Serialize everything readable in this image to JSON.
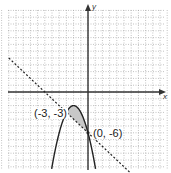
{
  "figure": {
    "type": "graph-of-system-of-inequalities",
    "axes": {
      "x_label": "x",
      "y_label": "y"
    },
    "grid": {
      "x_range": [
        -12,
        11
      ],
      "y_range": [
        -11,
        12
      ],
      "style": "dotted"
    },
    "curves": [
      {
        "name": "parabola",
        "equation": "y = -x^2 - 4x - 6",
        "style": "solid"
      },
      {
        "name": "line",
        "equation": "y = -x - 6",
        "style": "dashed"
      }
    ],
    "shaded_region": "between line and parabola for -3 <= x <= 0",
    "points": [
      {
        "label": "(-3, -3)",
        "x": -3,
        "y": -3
      },
      {
        "label": "(0, -6)",
        "x": 0,
        "y": -6
      }
    ],
    "colors": {
      "shade": "#c8c8c8",
      "ink": "#222222",
      "grid": "#9a9a9a"
    }
  }
}
